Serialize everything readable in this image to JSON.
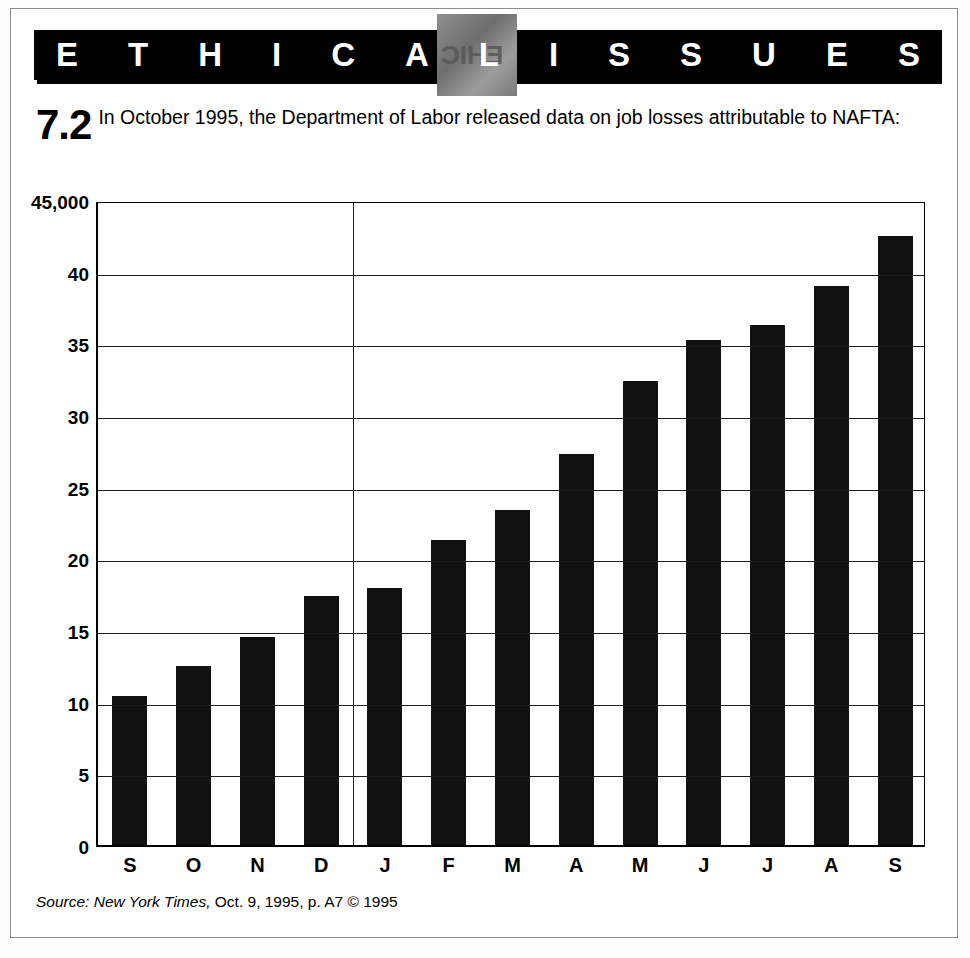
{
  "banner": {
    "title": "ETHICAL ISSUES",
    "letters": [
      "E",
      "T",
      "H",
      "I",
      "C",
      "A",
      "L",
      "I",
      "S",
      "S",
      "U",
      "E",
      "S"
    ],
    "watermark_text": "EHIC",
    "background_color": "#000000",
    "text_color": "#ffffff"
  },
  "item": {
    "number": "7.2",
    "text": "In October 1995, the Department of Labor released data on job losses attributable to NAFTA:"
  },
  "source": {
    "label": "Source:",
    "publication": "New York Times,",
    "details": "Oct. 9, 1995, p. A7 © 1995",
    "full": "Source: New York Times, Oct. 9, 1995, p. A7 © 1995"
  },
  "chart_data": {
    "type": "bar",
    "title": "",
    "subtitle": "",
    "xlabel": "",
    "ylabel": "",
    "categories": [
      "S",
      "O",
      "N",
      "D",
      "J",
      "F",
      "M",
      "A",
      "M",
      "J",
      "J",
      "A",
      "S"
    ],
    "values": [
      10.4,
      12.5,
      14.5,
      17.4,
      17.9,
      21.3,
      23.4,
      27.3,
      32.4,
      35.2,
      36.3,
      39.0,
      42.5
    ],
    "units": "thousands of jobs",
    "ylim": [
      0,
      45
    ],
    "ytick_labels": [
      "45,000",
      "40",
      "35",
      "30",
      "25",
      "20",
      "15",
      "10",
      "5",
      "0"
    ],
    "ytick_values": [
      45,
      40,
      35,
      30,
      25,
      20,
      15,
      10,
      5,
      0
    ],
    "grid": true,
    "grid_axis": "y",
    "legend": "none",
    "bar_color": "#111111",
    "axis_color": "#000000",
    "year_divider_after_index": 3,
    "annotations": []
  }
}
